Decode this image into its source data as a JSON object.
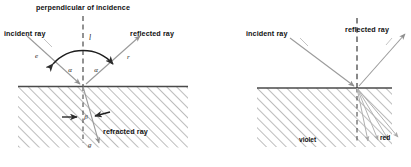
{
  "figure": {
    "title_left": "perpendicular of incidence",
    "panels": [
      {
        "id": "left-panel",
        "name": "reflection-refraction-diagram",
        "labels": {
          "normal_title": "perpendicular of incidence",
          "normal_short": "l",
          "incident": "incident ray",
          "reflected": "reflected ray",
          "refracted": "refracted ray",
          "angle_incidence_greek": "α",
          "angle_reflection_greek": "α",
          "angle_refraction_greek": "β",
          "ray_in_letter": "e",
          "ray_out_letter": "r",
          "ray_refr_letter": "g"
        }
      },
      {
        "id": "right-panel",
        "name": "dispersion-diagram",
        "labels": {
          "incident": "incident ray",
          "reflected": "reflected ray",
          "violet": "violet",
          "red": "red"
        }
      }
    ],
    "colors": {
      "ink": "#111111",
      "ray_gray": "#9a9a9a",
      "hatch": "#8c8c8c",
      "surface": "#4a4a4a",
      "background": "#ffffff"
    }
  }
}
